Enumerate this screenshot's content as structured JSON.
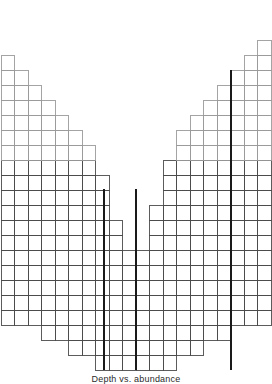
{
  "figure": {
    "caption": "Depth vs. abundance",
    "background": "#ffffff",
    "cell_stroke": "#9a9a9a",
    "cell_stroke_dark": "#4a4a4a",
    "marker_color": "#1a1a1a",
    "cell_fill": "none"
  },
  "chart_data": {
    "type": "bar",
    "title": "",
    "xlabel": "",
    "ylabel": "",
    "orientation": "vertical",
    "grid": true,
    "legend_position": "none",
    "cell_width_px": 13.5,
    "cell_height_px": 15.0,
    "origin_x_px": 1,
    "baseline_y_px": 370,
    "xlim": [
      0,
      20
    ],
    "ylim": [
      0,
      22
    ],
    "categories": [
      "1",
      "2",
      "3",
      "4",
      "5",
      "6",
      "7",
      "8",
      "9",
      "10",
      "11",
      "12",
      "13",
      "14",
      "15",
      "16",
      "17",
      "18",
      "19",
      "20"
    ],
    "values": [
      21,
      20,
      19,
      18,
      17,
      16,
      15,
      13,
      10,
      8,
      8,
      11,
      14,
      16,
      17,
      18,
      19,
      20,
      21,
      22
    ],
    "column_tops_px": [
      54,
      69,
      84,
      99,
      114,
      129,
      144,
      159,
      189,
      219,
      219,
      189,
      159,
      144,
      129,
      114,
      99,
      84,
      69,
      40
    ],
    "markers": [
      {
        "label": "marker-1",
        "x_px": 104,
        "y_top_px": 189,
        "y_bottom_px": 370
      },
      {
        "label": "marker-2",
        "x_px": 136,
        "y_top_px": 189,
        "y_bottom_px": 370
      },
      {
        "label": "marker-3",
        "x_px": 231,
        "y_top_px": 70,
        "y_bottom_px": 370
      }
    ],
    "bottom_taper": [
      {
        "row_from_bottom": 1,
        "col_start": 8,
        "col_end": 13
      },
      {
        "row_from_bottom": 2,
        "col_start": 6,
        "col_end": 15
      },
      {
        "row_from_bottom": 3,
        "col_start": 4,
        "col_end": 17
      }
    ]
  }
}
